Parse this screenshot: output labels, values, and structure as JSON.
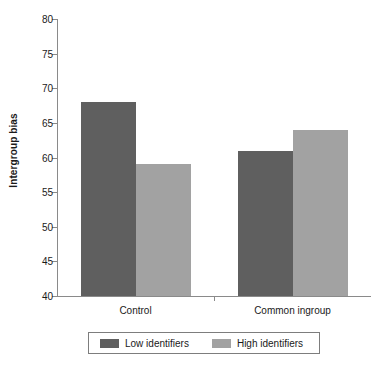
{
  "chart_data": {
    "type": "bar",
    "title": "",
    "xlabel": "",
    "ylabel": "Intergroup bias",
    "ylim": [
      40,
      80
    ],
    "ytick_step": 5,
    "yticks": [
      80,
      75,
      70,
      65,
      60,
      55,
      50,
      45,
      40
    ],
    "ytick_labels": [
      "80",
      "75",
      "70",
      "65",
      "60",
      "55",
      "50",
      "45",
      "40"
    ],
    "categories": [
      "Control",
      "Common ingroup"
    ],
    "grid": false,
    "legend_position": "bottom",
    "series": [
      {
        "name": "Low identifiers",
        "color": "#5f5f5f",
        "values": [
          68,
          61
        ]
      },
      {
        "name": "High identifiers",
        "color": "#a2a2a2",
        "values": [
          59,
          64
        ]
      }
    ],
    "annotations": []
  },
  "axis": {
    "y_title": "Intergroup bias",
    "line_color": "#8a8a8a"
  },
  "legend": {
    "entries": [
      {
        "label": "Low identifiers",
        "swatch_color": "#5f5f5f"
      },
      {
        "label": "High identifiers",
        "swatch_color": "#a2a2a2"
      }
    ],
    "border_color": "#7d7d7d"
  }
}
